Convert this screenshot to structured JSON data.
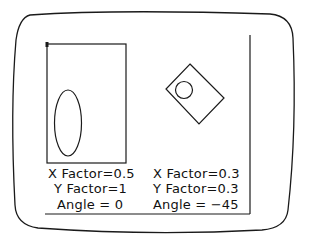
{
  "screen": {
    "description": "CRT monitor screen showing graphics transformation demo",
    "stroke_color": "#1a1a1a",
    "background": "#ffffff"
  },
  "left_figure": {
    "x_factor_label": "X Factor=0.5",
    "y_factor_label": "Y Factor=1",
    "angle_label": "Angle = 0"
  },
  "right_figure": {
    "x_factor_label": "X Factor=0.3",
    "y_factor_label": "Y Factor=0.3",
    "angle_label": "Angle = −45"
  }
}
